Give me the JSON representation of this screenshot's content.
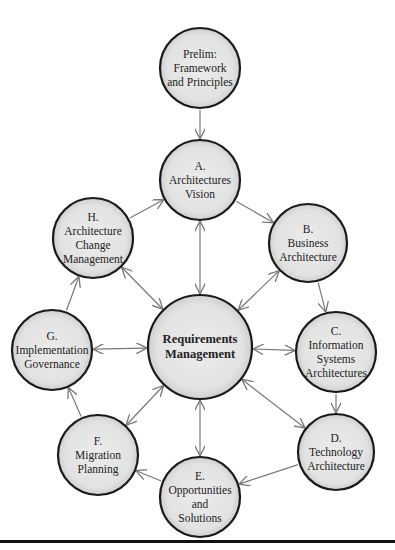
{
  "diagram": {
    "nodes": [
      {
        "id": "prelim",
        "lines": [
          "Prelim:",
          "Framework",
          "and Principles"
        ],
        "cx": 200,
        "cy": 68,
        "r": 40
      },
      {
        "id": "a",
        "lines": [
          "A.",
          "Architectures",
          "Vision"
        ],
        "cx": 200,
        "cy": 180,
        "r": 40
      },
      {
        "id": "b",
        "lines": [
          "B.",
          "Business",
          "Architecture"
        ],
        "cx": 308,
        "cy": 243,
        "r": 39
      },
      {
        "id": "c",
        "lines": [
          "C.",
          "Information",
          "Systems",
          "Architectures"
        ],
        "cx": 336,
        "cy": 352,
        "r": 40
      },
      {
        "id": "d",
        "lines": [
          "D.",
          "Technology",
          "Architecture"
        ],
        "cx": 336,
        "cy": 452,
        "r": 38
      },
      {
        "id": "e",
        "lines": [
          "E.",
          "Opportunities",
          "and",
          "Solutions"
        ],
        "cx": 200,
        "cy": 497,
        "r": 40
      },
      {
        "id": "f",
        "lines": [
          "F.",
          "Migration",
          "Planning"
        ],
        "cx": 98,
        "cy": 455,
        "r": 40
      },
      {
        "id": "g",
        "lines": [
          "G.",
          "Implementation",
          "Governance"
        ],
        "cx": 52,
        "cy": 350,
        "r": 40
      },
      {
        "id": "h",
        "lines": [
          "H.",
          "Architecture",
          "Change",
          "Management"
        ],
        "cx": 93,
        "cy": 238,
        "r": 40
      },
      {
        "id": "center",
        "lines": [
          "Requirements",
          "Management"
        ],
        "cx": 200,
        "cy": 347,
        "r": 52
      }
    ],
    "edges": [
      {
        "from": "prelim",
        "to": "a",
        "type": "one-way"
      },
      {
        "from": "a",
        "to": "b",
        "type": "one-way"
      },
      {
        "from": "b",
        "to": "c",
        "type": "one-way"
      },
      {
        "from": "c",
        "to": "d",
        "type": "one-way"
      },
      {
        "from": "d",
        "to": "e",
        "type": "one-way"
      },
      {
        "from": "e",
        "to": "f",
        "type": "one-way"
      },
      {
        "from": "f",
        "to": "g",
        "type": "one-way"
      },
      {
        "from": "g",
        "to": "h",
        "type": "one-way"
      },
      {
        "from": "h",
        "to": "a",
        "type": "one-way"
      },
      {
        "from": "center",
        "to": "a",
        "type": "two-way"
      },
      {
        "from": "center",
        "to": "b",
        "type": "two-way"
      },
      {
        "from": "center",
        "to": "c",
        "type": "two-way"
      },
      {
        "from": "center",
        "to": "d",
        "type": "two-way"
      },
      {
        "from": "center",
        "to": "e",
        "type": "two-way"
      },
      {
        "from": "center",
        "to": "f",
        "type": "two-way"
      },
      {
        "from": "center",
        "to": "g",
        "type": "two-way"
      },
      {
        "from": "center",
        "to": "h",
        "type": "two-way"
      }
    ],
    "colors": {
      "circle_fill": "#e4e4e4",
      "circle_stroke": "#1a1a1a",
      "arrow": "#777777",
      "rule": "#111111"
    }
  }
}
